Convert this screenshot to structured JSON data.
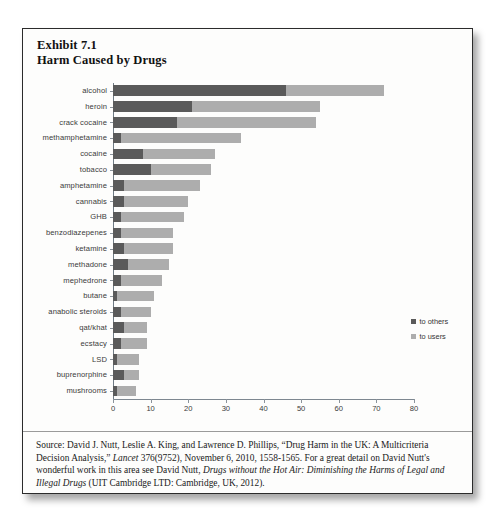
{
  "exhibit": {
    "number_line": "Exhibit 7.1",
    "title_line": "Harm Caused by Drugs"
  },
  "legend": {
    "others_label": "to others",
    "users_label": "to users",
    "others_color": "#5a5a5a",
    "users_color": "#adadad"
  },
  "source": {
    "part1": "Source: David J. Nutt, Leslie A. King, and Lawrence D. Phillips, “Drug Harm in the UK: A Multicriteria Decision Analysis,” ",
    "italic1": "Lancet",
    "part2": " 376(9752), November 6, 2010, 1558-1565.  For a great detail on David Nutt's wonderful work in this area see David Nutt, ",
    "italic2": "Drugs without the Hot Air: Diminishing the Harms of Legal and Illegal Drugs",
    "part3": " (UIT Cambridge LTD: Cambridge, UK, 2012)."
  },
  "chart_data": {
    "type": "bar",
    "orientation": "horizontal",
    "stacked": true,
    "title": "Harm Caused by Drugs",
    "xlabel": "",
    "ylabel": "",
    "xlim": [
      0,
      80
    ],
    "xticks": [
      0,
      10,
      20,
      30,
      40,
      50,
      60,
      70,
      80
    ],
    "grid": false,
    "legend_position": "right",
    "categories": [
      "alcohol",
      "heroin",
      "crack cocaine",
      "methamphetamine",
      "cocaine",
      "tobacco",
      "amphetamine",
      "cannabis",
      "GHB",
      "benzodiazepenes",
      "ketamine",
      "methadone",
      "mephedrone",
      "butane",
      "anabolic steroids",
      "qat/khat",
      "ecstacy",
      "LSD",
      "buprenorphine",
      "mushrooms"
    ],
    "series": [
      {
        "name": "to others",
        "color": "#5a5a5a",
        "values": [
          46,
          21,
          17,
          2,
          8,
          10,
          3,
          3,
          2,
          2,
          3,
          4,
          2,
          1,
          2,
          3,
          2,
          1,
          3,
          1
        ]
      },
      {
        "name": "to users",
        "color": "#adadad",
        "values": [
          26,
          34,
          37,
          32,
          19,
          16,
          20,
          17,
          17,
          14,
          13,
          11,
          11,
          10,
          8,
          6,
          7,
          6,
          4,
          5
        ]
      }
    ],
    "totals": [
      72,
      55,
      54,
      34,
      27,
      26,
      23,
      20,
      19,
      16,
      16,
      15,
      13,
      11,
      10,
      9,
      9,
      7,
      7,
      6
    ]
  }
}
